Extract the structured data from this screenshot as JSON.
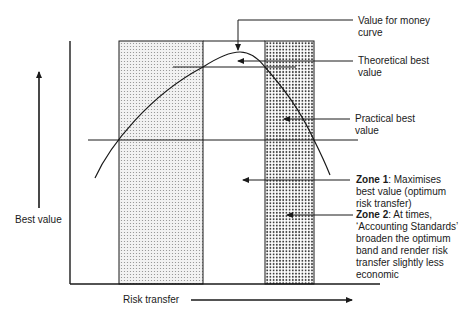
{
  "diagram": {
    "y_axis_label": "Best value",
    "x_axis_label": "Risk transfer",
    "annotations": {
      "value_for_money_curve": "Value for money curve",
      "theoretical_best_value": "Theoretical best value",
      "practical_best_value": "Practical best value",
      "zone1_title": "Zone 1",
      "zone1_text": ": Maximises best value (optimum risk transfer)",
      "zone2_title": "Zone 2",
      "zone2_text": ": At times, ‘Accounting Standards’ broaden the optimum band and render risk transfer slightly less economic"
    },
    "colors": {
      "line": "#1a1a1a",
      "zone1_dots": "#8a8a8a",
      "zone2_dots": "#3a3a3a"
    }
  }
}
